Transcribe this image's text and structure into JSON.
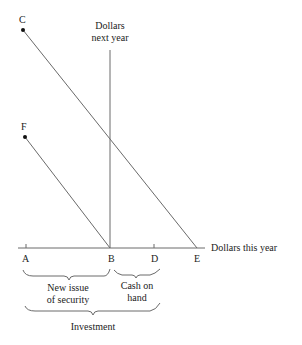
{
  "diagram": {
    "points": {
      "C": "C",
      "F": "F",
      "A": "A",
      "B": "B",
      "D": "D",
      "E": "E"
    },
    "axes": {
      "vertical_line1": "Dollars",
      "vertical_line2": "next year",
      "horizontal": "Dollars this year"
    },
    "braces": {
      "new_issue_line1": "New issue",
      "new_issue_line2": "of security",
      "cash_line1": "Cash on",
      "cash_line2": "hand",
      "investment": "Investment"
    },
    "colors": {
      "line": "#6a6a6a",
      "text": "#222222"
    }
  }
}
